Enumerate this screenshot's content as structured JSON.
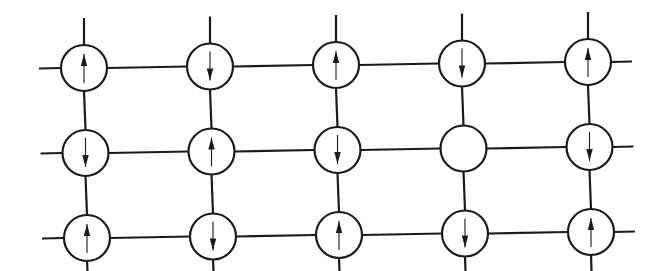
{
  "diagram": {
    "type": "spin-lattice",
    "colors": {
      "line": "#1a1a1a",
      "background": "#ffffff"
    },
    "rows": 3,
    "cols": 5,
    "sites": [
      [
        "up",
        "down",
        "up",
        "down",
        "up"
      ],
      [
        "down",
        "up",
        "down",
        "empty",
        "down"
      ],
      [
        "up",
        "down",
        "up",
        "down",
        "up"
      ]
    ]
  }
}
